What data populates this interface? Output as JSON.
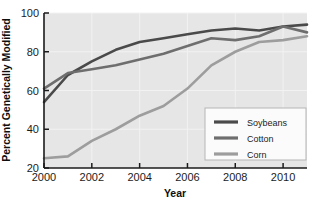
{
  "chart_data": {
    "type": "line",
    "title": "",
    "xlabel": "Year",
    "ylabel": "Percent Genetically Modified",
    "xlim": [
      2000,
      2011
    ],
    "ylim": [
      20,
      100
    ],
    "xticks": [
      2000,
      2002,
      2004,
      2006,
      2008,
      2010
    ],
    "yticks": [
      20,
      40,
      60,
      80,
      100
    ],
    "xtick_labels": [
      "2000",
      "2002",
      "2004",
      "2006",
      "2008",
      "2010"
    ],
    "ytick_labels": [
      "20",
      "40",
      "60",
      "80",
      "100"
    ],
    "grid": true,
    "legend_position": "lower right",
    "x": [
      2000,
      2001,
      2002,
      2003,
      2004,
      2005,
      2006,
      2007,
      2008,
      2009,
      2010,
      2011
    ],
    "series": [
      {
        "name": "Soybeans",
        "color": "#4a4a4a",
        "values": [
          54,
          68,
          75,
          81,
          85,
          87,
          89,
          91,
          92,
          91,
          93,
          94
        ]
      },
      {
        "name": "Cotton",
        "color": "#6e6e6e",
        "values": [
          61,
          69,
          71,
          73,
          76,
          79,
          83,
          87,
          86,
          88,
          93,
          90
        ]
      },
      {
        "name": "Corn",
        "color": "#9d9d9d",
        "values": [
          25,
          26,
          34,
          40,
          47,
          52,
          61,
          73,
          80,
          85,
          86,
          88
        ]
      }
    ]
  },
  "legend": {
    "entries": [
      {
        "label": "Soybeans",
        "color": "#4a4a4a"
      },
      {
        "label": "Cotton",
        "color": "#6e6e6e"
      },
      {
        "label": "Corn",
        "color": "#9d9d9d"
      }
    ]
  },
  "colors": {
    "plot_background": "#e6e6e6",
    "grid": "#f2f2f2",
    "axis": "#1b1b1b",
    "legend_background": "#fbfbfb",
    "legend_border": "#b5b5b5",
    "page_background": "#ffffff"
  }
}
